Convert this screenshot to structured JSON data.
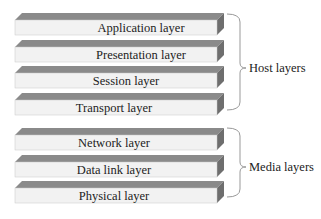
{
  "diagram": {
    "title": "",
    "layers": [
      {
        "label": "Application layer",
        "group": "host"
      },
      {
        "label": "Presentation layer",
        "group": "host"
      },
      {
        "label": "Session layer",
        "group": "host"
      },
      {
        "label": "Transport layer",
        "group": "host"
      },
      {
        "label": "Network layer",
        "group": "media"
      },
      {
        "label": "Data link layer",
        "group": "media"
      },
      {
        "label": "Physical layer",
        "group": "media"
      }
    ],
    "groups": {
      "host": {
        "label": "Host layers"
      },
      "media": {
        "label": "Media layers"
      }
    },
    "colors": {
      "front_face": "#f2f2f2",
      "top_face": "#8a8a8a",
      "side_face": "#6e6e6e",
      "bracket": "#999999"
    }
  }
}
